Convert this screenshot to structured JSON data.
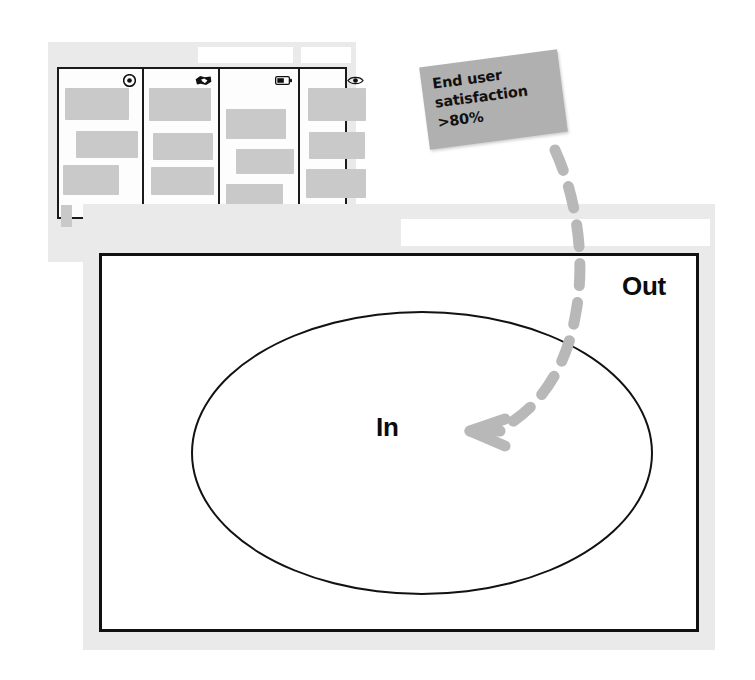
{
  "canvas": {
    "width": 755,
    "height": 680,
    "background": "#ffffff"
  },
  "colors": {
    "panel_gray": "#eaeaea",
    "card_gray": "#c9c9c9",
    "sticky_gray": "#b0b0b0",
    "arrow_gray": "#b8b8b8",
    "ink_black": "#111111",
    "white": "#ffffff"
  },
  "board_window": {
    "name": "Background board window",
    "title_placeholder_a": "",
    "title_placeholder_b": "",
    "columns": [
      {
        "icon": "target-icon",
        "cards": [
          {
            "width": 64,
            "height": 32
          },
          {
            "width": 62,
            "height": 27
          },
          {
            "width": 56,
            "height": 30
          }
        ]
      },
      {
        "icon": "handshake-icon",
        "cards": [
          {
            "width": 62,
            "height": 33
          },
          {
            "width": 60,
            "height": 27
          },
          {
            "width": 63,
            "height": 28
          }
        ]
      },
      {
        "icon": "battery-icon",
        "cards": [
          {
            "width": 60,
            "height": 30
          },
          {
            "width": 58,
            "height": 25
          },
          {
            "width": 57,
            "height": 28
          }
        ]
      },
      {
        "icon": "eye-icon",
        "cards": [
          {
            "width": 58,
            "height": 33
          },
          {
            "width": 56,
            "height": 27
          },
          {
            "width": 60,
            "height": 29
          }
        ]
      }
    ]
  },
  "sticky_note": {
    "name": "Sticky note",
    "text": "End user\nsatisfaction\n>80%",
    "color": "#b0b0b0",
    "rotation_deg": -7.5
  },
  "scope_window": {
    "name": "Scope diagram window",
    "title_placeholder": "",
    "labels": {
      "inside": "In",
      "outside": "Out"
    },
    "shape": "ellipse"
  },
  "connector": {
    "name": "Dashed connector arrow",
    "from": "sticky_note",
    "to": "scope_window.inside",
    "style": "dashed",
    "color": "#b8b8b8",
    "arrowhead": "chevron-left"
  }
}
